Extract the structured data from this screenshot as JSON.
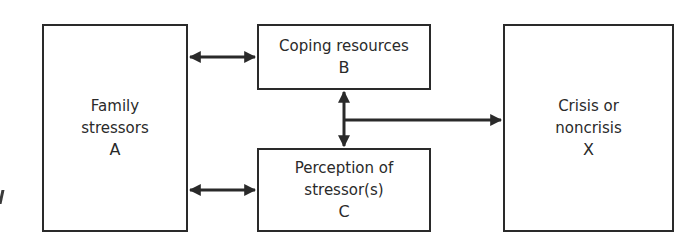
{
  "diagram": {
    "type": "flow-diagram",
    "nodes": {
      "A": {
        "line1": "Family",
        "line2": "stressors",
        "letter": "A"
      },
      "B": {
        "line1": "Coping resources",
        "letter": "B"
      },
      "C": {
        "line1": "Perception of",
        "line2": "stressor(s)",
        "letter": "C"
      },
      "X": {
        "line1": "Crisis or",
        "line2": "noncrisis",
        "letter": "X"
      }
    },
    "edges": [
      {
        "from": "A",
        "to": "B",
        "style": "bidirectional"
      },
      {
        "from": "A",
        "to": "C",
        "style": "bidirectional"
      },
      {
        "from": "B",
        "to": "C",
        "style": "bidirectional"
      },
      {
        "from": "B-C",
        "to": "X",
        "style": "directed"
      }
    ],
    "colors": {
      "stroke": "#2a2a2a",
      "background": "#ffffff"
    }
  }
}
